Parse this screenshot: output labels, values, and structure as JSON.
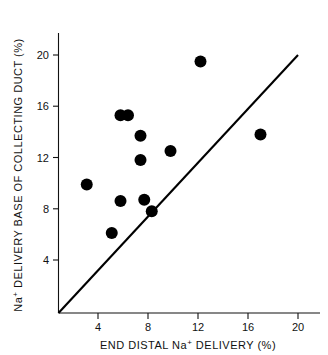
{
  "chart_data": {
    "type": "scatter",
    "title": "",
    "xlabel": "END DISTAL Na+ DELIVERY (%)",
    "ylabel": "Na+ DELIVERY BASE OF COLLECTING DUCT (%)",
    "xlabel_parts": {
      "pre": "END DISTAL Na",
      "sup": "+",
      "post": " DELIVERY (%)"
    },
    "ylabel_parts": {
      "pre": "Na",
      "sup": "+",
      "post": " DELIVERY BASE OF COLLECTING DUCT (%)"
    },
    "xlim": [
      0.8,
      21.2
    ],
    "ylim": [
      0.0,
      20.8
    ],
    "xticks": [
      4,
      8,
      12,
      16,
      20
    ],
    "yticks": [
      4,
      8,
      12,
      16,
      20
    ],
    "xtick_labels": [
      "4",
      "8",
      "12",
      "16",
      "20"
    ],
    "ytick_labels": [
      "4",
      "8",
      "12",
      "16",
      "20"
    ],
    "grid": false,
    "legend": null,
    "marker": "filled-circle",
    "marker_color": "#000000",
    "x": [
      3.1,
      5.1,
      5.8,
      5.8,
      6.4,
      7.4,
      7.4,
      7.7,
      8.3,
      9.8,
      12.2,
      17.0
    ],
    "y": [
      9.9,
      6.1,
      8.6,
      15.3,
      15.3,
      13.7,
      11.8,
      8.7,
      7.8,
      12.5,
      19.5,
      13.8
    ],
    "points": [
      {
        "x": 3.1,
        "y": 9.9
      },
      {
        "x": 5.1,
        "y": 6.1
      },
      {
        "x": 5.8,
        "y": 8.6
      },
      {
        "x": 5.8,
        "y": 15.3
      },
      {
        "x": 6.4,
        "y": 15.3
      },
      {
        "x": 7.4,
        "y": 13.7
      },
      {
        "x": 7.4,
        "y": 11.8
      },
      {
        "x": 7.7,
        "y": 8.7
      },
      {
        "x": 8.3,
        "y": 7.8
      },
      {
        "x": 9.8,
        "y": 12.5
      },
      {
        "x": 12.2,
        "y": 19.5
      },
      {
        "x": 17.0,
        "y": 13.8
      }
    ],
    "annotations": [
      {
        "name": "identity-line",
        "type": "line",
        "description": "line of identity y = x",
        "from": {
          "x": 0.8,
          "y": 0.0
        },
        "to": {
          "x": 20.0,
          "y": 20.2
        }
      }
    ]
  }
}
